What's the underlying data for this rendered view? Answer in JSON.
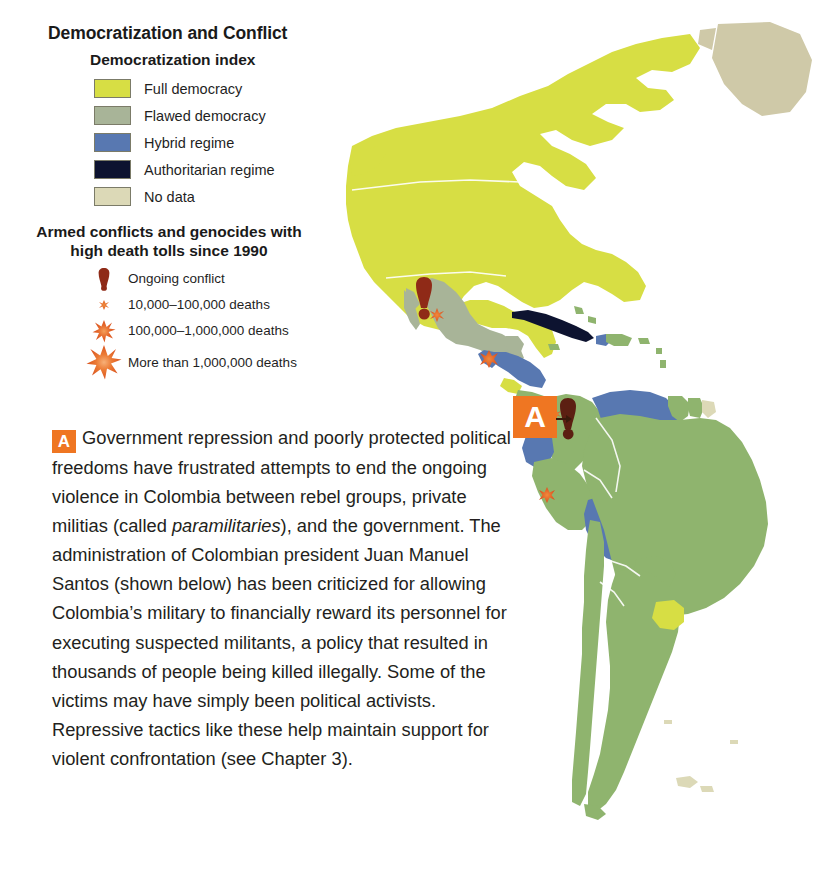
{
  "legend": {
    "title": "Democratization and Conflict",
    "index_title": "Democratization index",
    "index_items": [
      {
        "label": "Full democracy",
        "color": "#d7de44",
        "icon": "color-swatch"
      },
      {
        "label": "Flawed democracy",
        "color": "#a8b498",
        "icon": "color-swatch"
      },
      {
        "label": "Hybrid regime",
        "color": "#5878b1",
        "icon": "color-swatch"
      },
      {
        "label": "Authoritarian regime",
        "color": "#0d1330",
        "icon": "color-swatch"
      },
      {
        "label": "No data",
        "color": "#dcd9b7",
        "icon": "color-swatch"
      }
    ],
    "conflict_title_line1": "Armed conflicts and genocides with",
    "conflict_title_line2": "high death tolls since 1990",
    "conflict_items": [
      {
        "label": "Ongoing conflict",
        "icon": "exclamation-mark-icon",
        "color": "#8f2a17"
      },
      {
        "label": "10,000–100,000 deaths",
        "icon": "small-burst-icon",
        "color": "#e4662a"
      },
      {
        "label": "100,000–1,000,000 deaths",
        "icon": "medium-burst-icon",
        "color": "#e4662a"
      },
      {
        "label": "More than 1,000,000 deaths",
        "icon": "large-burst-icon",
        "color": "#e4662a"
      }
    ]
  },
  "callout": {
    "tag": "A",
    "tag_color": "#ef7622",
    "map_tag": "A"
  },
  "caption": {
    "tag": "A",
    "part1": "Government repression and poorly protected political freedoms have frustrated attempts to end the ongoing violence in Colombia between rebel groups, private militias (called ",
    "italic": "paramilitaries",
    "part2": "), and the government. The administration of Colombian president Juan Manuel Santos (shown below) has been criticized for allowing Colombia’s military to financially reward its personnel for executing suspected militants, a policy that resulted in thousands of people being killed illegally. Some of the victims may have simply been political activists. Repressive tactics like these help maintain support for violent confrontation (see Chapter 3)."
  },
  "map": {
    "ocean_color": "#ffffff",
    "border_color": "#ffffff",
    "regions": [
      {
        "name": "Canada",
        "category": "Full democracy",
        "color": "#d7de44"
      },
      {
        "name": "United States",
        "category": "Full democracy",
        "color": "#d7de44"
      },
      {
        "name": "Greenland",
        "category": "No data",
        "color": "#cfc9a8"
      },
      {
        "name": "Mexico",
        "category": "Flawed democracy",
        "color": "#a8b498"
      },
      {
        "name": "Guatemala",
        "category": "Hybrid regime",
        "color": "#5878b1"
      },
      {
        "name": "Honduras",
        "category": "Hybrid regime",
        "color": "#5878b1"
      },
      {
        "name": "Nicaragua",
        "category": "Hybrid regime",
        "color": "#5878b1"
      },
      {
        "name": "Costa Rica",
        "category": "Full democracy",
        "color": "#d7de44"
      },
      {
        "name": "Panama",
        "category": "Flawed democracy",
        "color": "#8fb46e"
      },
      {
        "name": "Cuba",
        "category": "Authoritarian regime",
        "color": "#0d1330"
      },
      {
        "name": "Haiti",
        "category": "Hybrid regime",
        "color": "#5878b1"
      },
      {
        "name": "Dominican Republic",
        "category": "Flawed democracy",
        "color": "#8fb46e"
      },
      {
        "name": "Colombia",
        "category": "Flawed democracy",
        "color": "#8fb46e"
      },
      {
        "name": "Venezuela",
        "category": "Hybrid regime",
        "color": "#5878b1"
      },
      {
        "name": "Ecuador",
        "category": "Hybrid regime",
        "color": "#5878b1"
      },
      {
        "name": "Peru",
        "category": "Flawed democracy",
        "color": "#8fb46e"
      },
      {
        "name": "Bolivia",
        "category": "Hybrid regime",
        "color": "#5878b1"
      },
      {
        "name": "Brazil",
        "category": "Flawed democracy",
        "color": "#8fb46e"
      },
      {
        "name": "Guyana",
        "category": "Flawed democracy",
        "color": "#8fb46e"
      },
      {
        "name": "Suriname",
        "category": "Flawed democracy",
        "color": "#8fb46e"
      },
      {
        "name": "French Guiana",
        "category": "No data",
        "color": "#dcd9b7"
      },
      {
        "name": "Paraguay",
        "category": "Flawed democracy",
        "color": "#8fb46e"
      },
      {
        "name": "Uruguay",
        "category": "Full democracy",
        "color": "#d7de44"
      },
      {
        "name": "Argentina",
        "category": "Flawed democracy",
        "color": "#8fb46e"
      },
      {
        "name": "Chile",
        "category": "Flawed democracy",
        "color": "#8fb46e"
      }
    ],
    "markers": [
      {
        "name": "Mexico ongoing conflict",
        "icon": "exclamation-mark-icon",
        "region": "Mexico"
      },
      {
        "name": "Mexico deaths",
        "icon": "small-burst-icon",
        "region": "Mexico"
      },
      {
        "name": "Guatemala deaths",
        "icon": "medium-burst-icon",
        "region": "Guatemala"
      },
      {
        "name": "Colombia ongoing conflict",
        "icon": "exclamation-mark-icon",
        "region": "Colombia"
      },
      {
        "name": "Colombia deaths",
        "icon": "small-burst-icon",
        "region": "Colombia"
      },
      {
        "name": "Peru deaths",
        "icon": "medium-burst-icon",
        "region": "Peru"
      }
    ]
  }
}
